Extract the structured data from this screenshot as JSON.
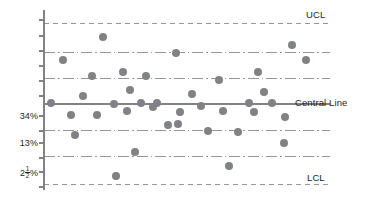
{
  "chart_data": {
    "type": "scatter",
    "title": "",
    "subtitle": "",
    "xlabel": "",
    "ylabel": "",
    "grid": true,
    "legend_position": "right",
    "colors": {
      "point": "#808285",
      "central_line": "#808285",
      "zone_line": "#939598",
      "control_limit_line": "#939598",
      "axis": "#808285",
      "text": "#231f20"
    },
    "axis": {
      "x_pixel": 44,
      "y_top_pixel": 10,
      "y_bottom_pixel": 190,
      "plot_right_pixel": 330
    },
    "y_tick_labels": [
      {
        "label": "34%",
        "y": 116
      },
      {
        "label": "13%",
        "y": 143
      },
      {
        "label": "2 1/2 %",
        "y": 172,
        "whole": "2",
        "numerator": "1",
        "denominator": "2",
        "suffix": "%"
      }
    ],
    "y_tick_marks": [
      20,
      36,
      51,
      66,
      81,
      96,
      116,
      131,
      143,
      158,
      172,
      187
    ],
    "reference_lines": [
      {
        "name": "UCL",
        "y": 23,
        "style": "dashed",
        "label": "UCL",
        "label_y": 14,
        "width": 1.0
      },
      {
        "name": "zone-upper-2",
        "y": 52,
        "style": "dash-dot",
        "label": "",
        "width": 1.0
      },
      {
        "name": "zone-upper-1",
        "y": 78,
        "style": "dash-dot",
        "label": "",
        "width": 1.0
      },
      {
        "name": "Central Line",
        "y": 104,
        "style": "solid",
        "label": "Central Line",
        "label_y": 96,
        "width": 1.8
      },
      {
        "name": "zone-lower-1",
        "y": 130,
        "style": "dash-dot",
        "label": "",
        "width": 1.0
      },
      {
        "name": "zone-lower-2",
        "y": 156,
        "style": "dash-dot",
        "label": "",
        "width": 1.0
      },
      {
        "name": "LCL",
        "y": 184,
        "style": "dashed",
        "label": "LCL",
        "label_y": 175,
        "width": 1.0
      }
    ],
    "point_radius": 4.0,
    "points": [
      {
        "x": 51,
        "y": 103
      },
      {
        "x": 63,
        "y": 60
      },
      {
        "x": 71,
        "y": 115
      },
      {
        "x": 75,
        "y": 135
      },
      {
        "x": 83,
        "y": 96
      },
      {
        "x": 92,
        "y": 76
      },
      {
        "x": 97,
        "y": 115
      },
      {
        "x": 103,
        "y": 37
      },
      {
        "x": 114,
        "y": 104
      },
      {
        "x": 116,
        "y": 176
      },
      {
        "x": 123,
        "y": 72
      },
      {
        "x": 127,
        "y": 111
      },
      {
        "x": 130,
        "y": 90
      },
      {
        "x": 135,
        "y": 152
      },
      {
        "x": 141,
        "y": 103
      },
      {
        "x": 146,
        "y": 76
      },
      {
        "x": 153,
        "y": 107
      },
      {
        "x": 157,
        "y": 103
      },
      {
        "x": 168,
        "y": 125
      },
      {
        "x": 176,
        "y": 53
      },
      {
        "x": 178,
        "y": 124
      },
      {
        "x": 180,
        "y": 112
      },
      {
        "x": 192,
        "y": 94
      },
      {
        "x": 201,
        "y": 106
      },
      {
        "x": 208,
        "y": 131
      },
      {
        "x": 219,
        "y": 80
      },
      {
        "x": 223,
        "y": 111
      },
      {
        "x": 229,
        "y": 166
      },
      {
        "x": 238,
        "y": 132
      },
      {
        "x": 249,
        "y": 103
      },
      {
        "x": 254,
        "y": 112
      },
      {
        "x": 258,
        "y": 72
      },
      {
        "x": 264,
        "y": 92
      },
      {
        "x": 272,
        "y": 103
      },
      {
        "x": 285,
        "y": 117
      },
      {
        "x": 284,
        "y": 143
      },
      {
        "x": 292,
        "y": 45
      },
      {
        "x": 306,
        "y": 60
      }
    ]
  }
}
